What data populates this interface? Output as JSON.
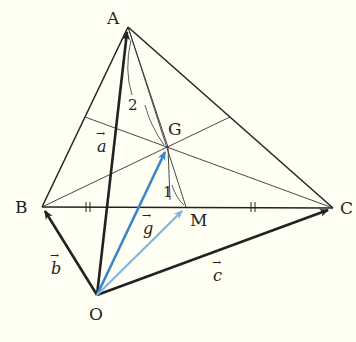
{
  "points": {
    "A": {
      "label": "A",
      "x": 128,
      "y": 27
    },
    "B": {
      "label": "B",
      "x": 42,
      "y": 207
    },
    "C": {
      "label": "C",
      "x": 333,
      "y": 208
    },
    "O": {
      "label": "O",
      "x": 97,
      "y": 295
    },
    "M": {
      "label": "M",
      "x": 186,
      "y": 207
    },
    "G": {
      "label": "G",
      "x": 168,
      "y": 147
    }
  },
  "vectors": {
    "a": {
      "letter": "a",
      "arrow": "→"
    },
    "b": {
      "letter": "b",
      "arrow": "→"
    },
    "c": {
      "letter": "c",
      "arrow": "→"
    },
    "g": {
      "letter": "g",
      "arrow": "→"
    }
  },
  "ratio": {
    "upper": "2",
    "lower": "1"
  },
  "colors": {
    "line": "#222222",
    "vector_g": "#3a86c8",
    "vector_om": "#7fb6e0",
    "background": "#fffff4"
  }
}
